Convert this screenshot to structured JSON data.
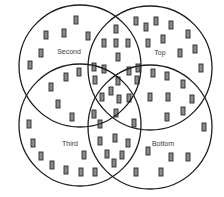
{
  "diagram": {
    "type": "venn",
    "set_count": 4,
    "colors": {
      "outline": "#1e1e1e",
      "marker_fill": "#8a8a8a",
      "marker_stroke": "#2a2a2a",
      "label": "#3a3a3a",
      "background": "#ffffff"
    },
    "sets": [
      {
        "name": "Second",
        "label": "Second",
        "cx": 80,
        "cy": 66,
        "r": 61,
        "label_x": 69,
        "label_y": 54
      },
      {
        "name": "Top",
        "label": "Top",
        "cx": 150,
        "cy": 68,
        "r": 62,
        "label_x": 160,
        "label_y": 55
      },
      {
        "name": "Third",
        "label": "Third",
        "cx": 80,
        "cy": 125,
        "r": 61,
        "label_x": 70,
        "label_y": 146
      },
      {
        "name": "Bottom",
        "label": "Bottom",
        "cx": 150,
        "cy": 127,
        "r": 62,
        "label_x": 163,
        "label_y": 146
      }
    ],
    "marker_size": {
      "w": 4,
      "h": 8
    },
    "markers": [
      [
        76,
        20
      ],
      [
        116,
        29
      ],
      [
        136,
        21
      ],
      [
        146,
        27
      ],
      [
        156,
        21
      ],
      [
        171,
        25
      ],
      [
        188,
        34
      ],
      [
        46,
        35
      ],
      [
        64,
        33
      ],
      [
        88,
        36
      ],
      [
        104,
        43
      ],
      [
        116,
        43
      ],
      [
        128,
        43
      ],
      [
        148,
        43
      ],
      [
        163,
        39
      ],
      [
        195,
        49
      ],
      [
        41,
        53
      ],
      [
        118,
        57
      ],
      [
        180,
        53
      ],
      [
        30,
        65
      ],
      [
        94,
        67
      ],
      [
        104,
        69
      ],
      [
        129,
        71
      ],
      [
        138,
        68
      ],
      [
        153,
        73
      ],
      [
        167,
        76
      ],
      [
        201,
        68
      ],
      [
        79,
        72
      ],
      [
        66,
        77
      ],
      [
        95,
        80
      ],
      [
        118,
        81
      ],
      [
        137,
        80
      ],
      [
        183,
        84
      ],
      [
        51,
        87
      ],
      [
        111,
        91
      ],
      [
        102,
        97
      ],
      [
        119,
        99
      ],
      [
        129,
        98
      ],
      [
        150,
        97
      ],
      [
        168,
        97
      ],
      [
        192,
        99
      ],
      [
        58,
        104
      ],
      [
        183,
        111
      ],
      [
        94,
        114
      ],
      [
        116,
        113
      ],
      [
        72,
        117
      ],
      [
        167,
        117
      ],
      [
        100,
        124
      ],
      [
        134,
        123
      ],
      [
        204,
        127
      ],
      [
        29,
        124
      ],
      [
        100,
        141
      ],
      [
        115,
        138
      ],
      [
        128,
        143
      ],
      [
        33,
        143
      ],
      [
        148,
        151
      ],
      [
        84,
        155
      ],
      [
        107,
        154
      ],
      [
        122,
        155
      ],
      [
        41,
        156
      ],
      [
        171,
        157
      ],
      [
        188,
        157
      ],
      [
        114,
        163
      ],
      [
        52,
        165
      ],
      [
        66,
        170
      ],
      [
        81,
        172
      ],
      [
        95,
        172
      ],
      [
        136,
        172
      ],
      [
        161,
        172
      ]
    ]
  }
}
